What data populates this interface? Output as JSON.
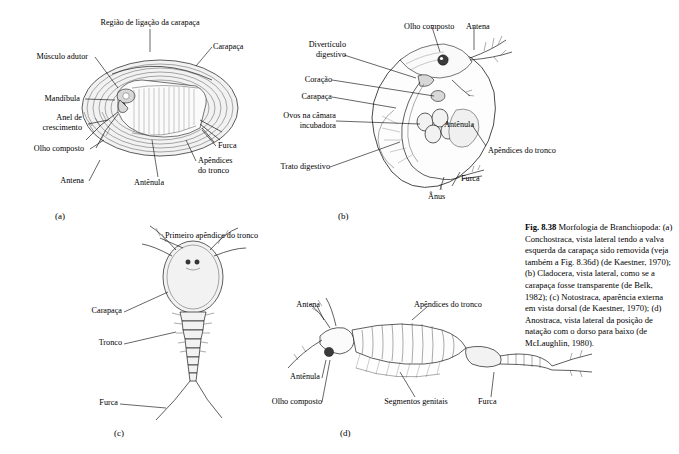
{
  "figure": {
    "panels": [
      {
        "id": "a",
        "letter": "(a)",
        "labels": [
          "Região de ligação da carapaça",
          "Músculo adutor",
          "Mandíbula",
          "Anel de\ncrescimento",
          "Olho composto",
          "Antena",
          "Carapaça",
          "Furca",
          "Apêndices\ndo tronco",
          "Antênula"
        ]
      },
      {
        "id": "b",
        "letter": "(b)",
        "labels": [
          "Olho composto",
          "Antena",
          "Divertículo\ndigestivo",
          "Coração",
          "Carapaça",
          "Ovos na câmara\nincubadora",
          "Trato digestivo",
          "Antênula",
          "Apêndices do tronco",
          "Furca",
          "Ânus"
        ]
      },
      {
        "id": "c",
        "letter": "(c)",
        "labels": [
          "Primeiro apêndice do tronco",
          "Carapaça",
          "Tronco",
          "Furca"
        ]
      },
      {
        "id": "d",
        "letter": "(d)",
        "labels": [
          "Antena",
          "Apêndices do tronco",
          "Antênula",
          "Olho composto",
          "Segmentos genitais",
          "Furca"
        ]
      }
    ],
    "caption": {
      "number": "Fig. 8.38",
      "title": "Morfologia de Branchiopoda:",
      "entries": [
        "(a) Conchostraca, vista lateral tendo a valva esquerda da carapaça sido removida (veja também a Fig. 8.36d) (de Kaestner, 1970);",
        "(b) Cladocera, vista lateral, como se a carapaça fosse transparente (de Belk, 1982);",
        "(c) Notostraca, aparência externa em vista dorsal (de Kaestner, 1970);",
        "(d) Anostraca, vista lateral da posição de natação com o dorso para baixo (de McLaughlin, 1980)."
      ]
    }
  }
}
